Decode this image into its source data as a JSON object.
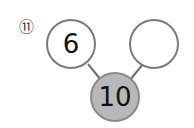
{
  "problem": {
    "number_label": "⑪"
  },
  "number_bond": {
    "parts": [
      {
        "position": "left",
        "value": "6"
      },
      {
        "position": "right",
        "value": ""
      }
    ],
    "whole": {
      "value": "10"
    }
  },
  "colors": {
    "part_fill": "#ffffff",
    "whole_fill": "#b8b8b8",
    "outline": "#7a7a7a",
    "connector": "#6e6e6e",
    "text": "#111111"
  }
}
